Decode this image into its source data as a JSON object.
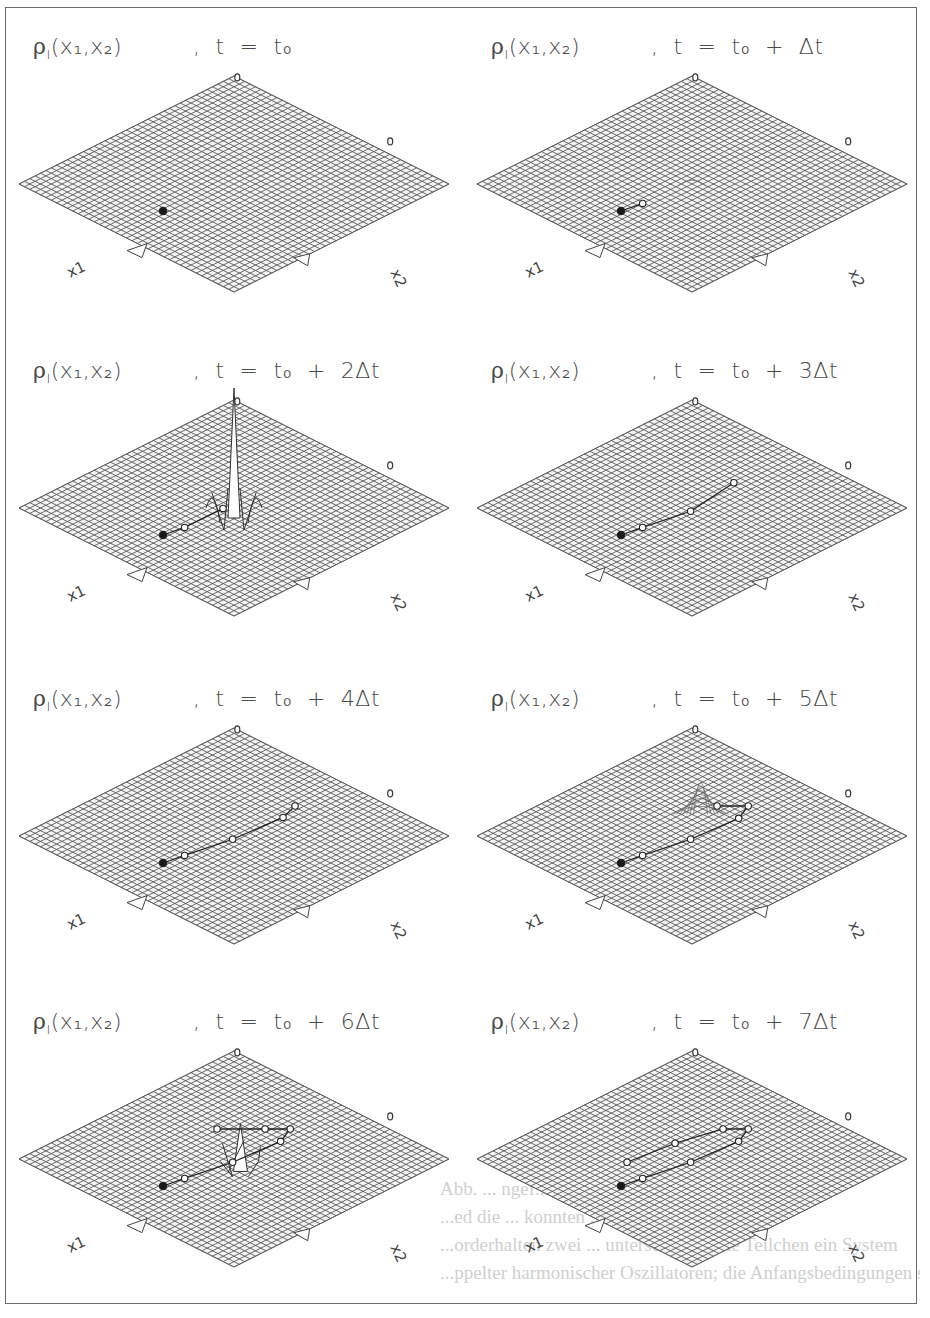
{
  "figure": {
    "colors": {
      "grid": "#5a5a5a",
      "frame": "#6b6b6b",
      "text": "#4a4a4a",
      "marker_fill": "#1a1a1a",
      "bleed_text": "#cfcfcf"
    },
    "axis_labels": {
      "x1": "x1",
      "x2": "x2"
    },
    "density_symbol": "ρI(x1,x2)",
    "panels": [
      {
        "title_left": "ρ",
        "title_sub": "I",
        "title_args": "(x₁,x₂)",
        "time_label": ",  t  =  t₀",
        "step": 0,
        "row": 0,
        "col": 0,
        "peak": "none",
        "trajectory": [
          [
            0,
            0
          ]
        ]
      },
      {
        "title_left": "ρ",
        "title_sub": "I",
        "title_args": "(x₁,x₂)",
        "time_label": ",  t  =  t₀  +  Δt",
        "step": 1,
        "row": 0,
        "col": 1,
        "peak": "small-bump",
        "trajectory": [
          [
            0,
            0
          ],
          [
            0.18,
            0.08
          ]
        ]
      },
      {
        "title_left": "ρ",
        "title_sub": "I",
        "title_args": "(x₁,x₂)",
        "time_label": ",  t  =  t₀  +  2Δt",
        "step": 2,
        "row": 1,
        "col": 0,
        "peak": "tall-spike",
        "trajectory": [
          [
            0,
            0
          ],
          [
            0.18,
            0.08
          ],
          [
            0.5,
            0.28
          ]
        ]
      },
      {
        "title_left": "ρ",
        "title_sub": "I",
        "title_args": "(x₁,x₂)",
        "time_label": ",  t  =  t₀  +  3Δt",
        "step": 3,
        "row": 1,
        "col": 1,
        "peak": "none",
        "trajectory": [
          [
            0,
            0
          ],
          [
            0.18,
            0.08
          ],
          [
            0.58,
            0.25
          ],
          [
            0.94,
            0.55
          ]
        ]
      },
      {
        "title_left": "ρ",
        "title_sub": "I",
        "title_args": "(x₁,x₂)",
        "time_label": ",  t  =  t₀  +  4Δt",
        "step": 4,
        "row": 2,
        "col": 0,
        "peak": "none",
        "trajectory": [
          [
            0,
            0
          ],
          [
            0.18,
            0.08
          ],
          [
            0.58,
            0.25
          ],
          [
            1.0,
            0.48
          ],
          [
            1.1,
            0.6
          ]
        ]
      },
      {
        "title_left": "ρ",
        "title_sub": "I",
        "title_args": "(x₁,x₂)",
        "time_label": ",  t  =  t₀  +  5Δt",
        "step": 5,
        "row": 2,
        "col": 1,
        "peak": "gaussian-bump",
        "trajectory": [
          [
            0,
            0
          ],
          [
            0.18,
            0.08
          ],
          [
            0.58,
            0.25
          ],
          [
            0.98,
            0.47
          ],
          [
            1.06,
            0.6
          ],
          [
            0.8,
            0.6
          ]
        ]
      },
      {
        "title_left": "ρ",
        "title_sub": "I",
        "title_args": "(x₁,x₂)",
        "time_label": ",  t  =  t₀  +  6Δt",
        "step": 6,
        "row": 3,
        "col": 0,
        "peak": "spike-star",
        "trajectory": [
          [
            0,
            0
          ],
          [
            0.18,
            0.08
          ],
          [
            0.58,
            0.25
          ],
          [
            0.98,
            0.47
          ],
          [
            1.06,
            0.6
          ],
          [
            0.85,
            0.6
          ],
          [
            0.45,
            0.6
          ]
        ]
      },
      {
        "title_left": "ρ",
        "title_sub": "I",
        "title_args": "(x₁,x₂)",
        "time_label": ",  t  =  t₀  +  7Δt",
        "step": 7,
        "row": 3,
        "col": 1,
        "peak": "none",
        "trajectory": [
          [
            0,
            0
          ],
          [
            0.18,
            0.08
          ],
          [
            0.58,
            0.25
          ],
          [
            0.98,
            0.47
          ],
          [
            1.06,
            0.6
          ],
          [
            0.85,
            0.6
          ],
          [
            0.45,
            0.45
          ],
          [
            0.05,
            0.25
          ]
        ]
      }
    ],
    "bleed_through_lines": [
      "Abb. ... ngef... nar... nd ... ohne... dem zweiten",
      "...ed die ... konnten ... n ... nd ... dung; für die",
      "...orderhalten zwei ... unterschied ... die Teilchen ein System",
      "...ppelter harmonischer Oszillatoren; die Anfangsbedingungen sind wie in Abb. 2"
    ]
  }
}
